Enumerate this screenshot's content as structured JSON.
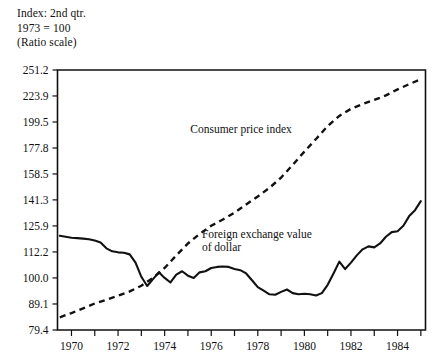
{
  "header": {
    "line1": "Index: 2nd qtr.",
    "line2": "1973 = 100",
    "line3": "(Ratio scale)"
  },
  "chart_data": {
    "type": "line",
    "title": "",
    "subtitle": "",
    "xlabel": "",
    "ylabel": "Index: 2nd qtr. 1973 = 100 (Ratio scale)",
    "scale": "log",
    "grid": false,
    "legend": "inline-annotations",
    "xlim": [
      1969.4,
      1985.2
    ],
    "ylim": [
      79.4,
      251.2
    ],
    "yticks": [
      251.2,
      223.9,
      199.5,
      177.8,
      158.5,
      141.3,
      125.9,
      112.2,
      100.0,
      89.1,
      79.4
    ],
    "ytick_labels": [
      "251.2",
      "223.9",
      "199.5",
      "177.8",
      "158.5",
      "141.3",
      "125.9",
      "112.2",
      "100.0",
      "89.1",
      "79.4"
    ],
    "xticks_major": [
      1970,
      1972,
      1974,
      1976,
      1978,
      1980,
      1982,
      1984
    ],
    "xtick_labels": [
      "1970",
      "1972",
      "1974",
      "1976",
      "1978",
      "1980",
      "1982",
      "1984"
    ],
    "xticks_minor": [
      1971,
      1973,
      1975,
      1977,
      1979,
      1981,
      1983,
      1985
    ],
    "series": [
      {
        "name": "Consumer price index",
        "style": "dashed",
        "color": "#111111",
        "label_x": 1975.1,
        "label_y": 190.0,
        "x": [
          1969.5,
          1970.0,
          1970.5,
          1971.0,
          1971.5,
          1972.0,
          1972.5,
          1973.0,
          1973.5,
          1974.0,
          1974.5,
          1975.0,
          1975.5,
          1976.0,
          1976.5,
          1977.0,
          1977.5,
          1978.0,
          1978.5,
          1979.0,
          1979.5,
          1980.0,
          1980.5,
          1981.0,
          1981.5,
          1982.0,
          1982.5,
          1983.0,
          1983.5,
          1984.0,
          1984.5,
          1985.0
        ],
        "y": [
          84.0,
          85.6,
          87.4,
          89.3,
          90.8,
          92.4,
          94.2,
          96.6,
          100.0,
          104.5,
          110.5,
          116.5,
          121.5,
          126.0,
          129.5,
          133.5,
          138.5,
          143.5,
          149.0,
          156.0,
          165.0,
          175.0,
          185.0,
          196.0,
          205.0,
          211.5,
          216.0,
          220.0,
          224.5,
          230.5,
          236.0,
          241.0
        ]
      },
      {
        "name": "Foreign exchange value of dollar",
        "style": "solid",
        "color": "#111111",
        "label_x": 1975.6,
        "label_y": 119.5,
        "x": [
          1969.5,
          1969.75,
          1970.0,
          1970.25,
          1970.5,
          1970.75,
          1971.0,
          1971.25,
          1971.5,
          1971.75,
          1972.0,
          1972.25,
          1972.5,
          1972.75,
          1973.0,
          1973.25,
          1973.5,
          1973.75,
          1974.0,
          1974.25,
          1974.5,
          1974.75,
          1975.0,
          1975.25,
          1975.5,
          1975.75,
          1976.0,
          1976.25,
          1976.5,
          1976.75,
          1977.0,
          1977.25,
          1977.5,
          1977.75,
          1978.0,
          1978.25,
          1978.5,
          1978.75,
          1979.0,
          1979.25,
          1979.5,
          1979.75,
          1980.0,
          1980.25,
          1980.5,
          1980.75,
          1981.0,
          1981.25,
          1981.5,
          1981.75,
          1982.0,
          1982.25,
          1982.5,
          1982.75,
          1983.0,
          1983.25,
          1983.5,
          1983.75,
          1984.0,
          1984.25,
          1984.5,
          1984.75,
          1985.0
        ],
        "y": [
          120.5,
          120.0,
          119.5,
          119.3,
          119.0,
          118.7,
          118.0,
          117.0,
          114.0,
          112.5,
          112.0,
          111.8,
          111.0,
          107.0,
          100.5,
          96.5,
          99.5,
          102.5,
          100.0,
          98.0,
          101.5,
          103.0,
          101.0,
          100.0,
          102.5,
          103.0,
          104.5,
          105.0,
          105.2,
          105.0,
          104.0,
          103.5,
          102.0,
          99.0,
          96.0,
          94.5,
          93.0,
          92.8,
          94.0,
          95.0,
          93.5,
          93.0,
          93.2,
          93.0,
          92.5,
          93.5,
          97.0,
          102.0,
          107.5,
          104.0,
          107.0,
          110.5,
          113.5,
          115.0,
          114.5,
          116.5,
          120.0,
          122.5,
          123.0,
          126.0,
          131.5,
          135.0,
          140.5
        ]
      }
    ],
    "annotations": [
      {
        "text": "Consumer price index",
        "x": 1975.1,
        "y": 190.0
      },
      {
        "text": "Foreign exchange value",
        "x": 1975.6,
        "y": 119.5
      },
      {
        "text": "of dollar",
        "x": 1975.6,
        "y": 112.8
      }
    ]
  }
}
